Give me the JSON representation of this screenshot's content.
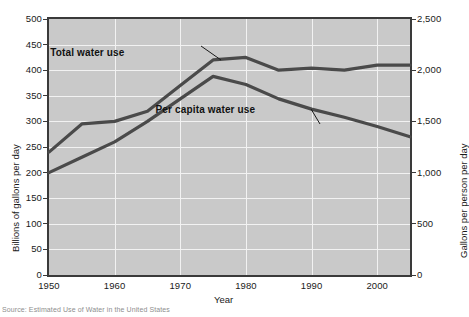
{
  "chart_data": {
    "type": "line",
    "title": "",
    "xlabel": "Year",
    "ylabel": "Billions of gallons per day",
    "y2label": "Gallons per person per day",
    "grid": true,
    "legend_position": "inline-annotations",
    "xlim": [
      1950,
      2005
    ],
    "ylim": [
      0,
      500
    ],
    "y2lim": [
      0,
      2500
    ],
    "x_ticks": [
      "1950",
      "1960",
      "1970",
      "1980",
      "1990",
      "2000"
    ],
    "x_tick_values": [
      1950,
      1960,
      1970,
      1980,
      1990,
      2000
    ],
    "y_ticks": [
      "0",
      "50",
      "100",
      "150",
      "200",
      "250",
      "300",
      "350",
      "400",
      "450",
      "500"
    ],
    "y_tick_values": [
      0,
      50,
      100,
      150,
      200,
      250,
      300,
      350,
      400,
      450,
      500
    ],
    "y2_ticks": [
      "0",
      "500",
      "1,000",
      "1,500",
      "2,000",
      "2,500"
    ],
    "y2_tick_values": [
      0,
      500,
      1000,
      1500,
      2000,
      2500
    ],
    "x": [
      1950,
      1955,
      1960,
      1965,
      1970,
      1975,
      1980,
      1985,
      1990,
      1995,
      2000,
      2005
    ],
    "series": [
      {
        "name": "Total water use",
        "axis": "left",
        "units": "billions of gallons per day",
        "values": [
          240,
          295,
          300,
          320,
          370,
          420,
          425,
          400,
          404,
          400,
          410,
          410
        ],
        "color": "#4a4a4a"
      },
      {
        "name": "Per capita water use",
        "axis": "right",
        "units": "gallons per person per day",
        "values": [
          1000,
          1150,
          1300,
          1500,
          1720,
          1940,
          1860,
          1720,
          1620,
          1540,
          1450,
          1350
        ],
        "color": "#4a4a4a"
      }
    ],
    "annotations": [
      {
        "text": "Total water use",
        "x": 1957.5,
        "y": 432
      },
      {
        "text": "Per capita water use",
        "x": 1970.5,
        "y": 320
      }
    ],
    "colors": {
      "plot_background": "#c9c9c9",
      "gridline": "#f2f2f2",
      "axis": "#3a3a3a",
      "line": "#4a4a4a",
      "text": "#1a1a1a"
    }
  },
  "source": {
    "text": "Source: Estimated Use of Water in the United States"
  }
}
